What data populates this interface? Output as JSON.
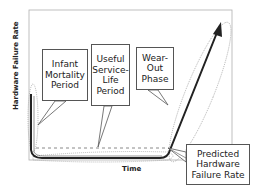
{
  "diagram": {
    "type": "bathtub-curve",
    "axes": {
      "y_label": "Hardware Failure Rate",
      "x_label": "Time"
    },
    "callouts": {
      "infant": [
        "Infant",
        "Mortality",
        "Period"
      ],
      "useful": [
        "Useful",
        "Service-",
        "Life",
        "Period"
      ],
      "wearout": [
        "Wear-",
        "Out",
        "Phase"
      ],
      "predicted": [
        "Predicted",
        "Hardware",
        "Failure Rate"
      ]
    },
    "colors": {
      "frame": "#aaaaaa",
      "curve": "#222222",
      "dotted": "#888888",
      "callout_border": "#555555",
      "text": "#222222"
    }
  }
}
